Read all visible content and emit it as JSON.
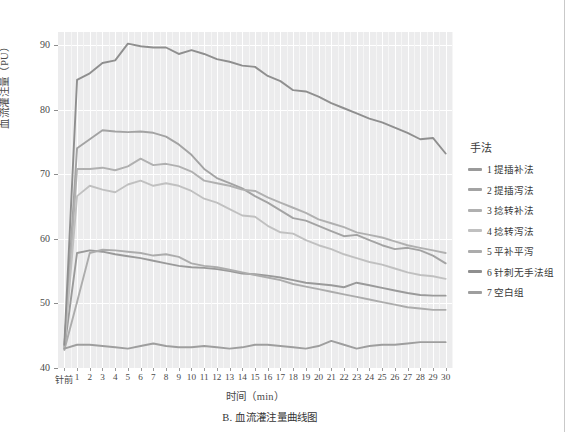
{
  "figure": {
    "caption": "B. 血流灌注量曲线图"
  },
  "axes": {
    "ylabel": "血流灌注量（PU）",
    "xlabel": "时间（min）",
    "yticks": [
      "40",
      "50",
      "60",
      "70",
      "80",
      "90"
    ],
    "xticks": [
      "针前",
      "1",
      "2",
      "3",
      "4",
      "5",
      "6",
      "7",
      "8",
      "9",
      "10",
      "11",
      "12",
      "13",
      "14",
      "15",
      "16",
      "17",
      "18",
      "19",
      "20",
      "21",
      "22",
      "23",
      "24",
      "25",
      "26",
      "27",
      "28",
      "29",
      "30"
    ]
  },
  "legend": {
    "title": "手法",
    "items": [
      {
        "label": "1 提插补法",
        "color": "#9a9a9a"
      },
      {
        "label": "2 提插泻法",
        "color": "#a3a3a3"
      },
      {
        "label": "3 捻转补法",
        "color": "#b0b0b0"
      },
      {
        "label": "4 捻转泻法",
        "color": "#c0c0c0"
      },
      {
        "label": "5 平补平泻",
        "color": "#acacac"
      },
      {
        "label": "6 针刺无手法组",
        "color": "#8f8f8f"
      },
      {
        "label": "7 空白组",
        "color": "#9e9e9e"
      }
    ]
  },
  "chart_data": {
    "type": "line",
    "title": "B. 血流灌注量曲线图",
    "xlabel": "时间（min）",
    "ylabel": "血流灌注量（PU）",
    "ylim": [
      40,
      92
    ],
    "grid": true,
    "legend_position": "right",
    "legend_title": "手法",
    "x": [
      "针前",
      "1",
      "2",
      "3",
      "4",
      "5",
      "6",
      "7",
      "8",
      "9",
      "10",
      "11",
      "12",
      "13",
      "14",
      "15",
      "16",
      "17",
      "18",
      "19",
      "20",
      "21",
      "22",
      "23",
      "24",
      "25",
      "26",
      "27",
      "28",
      "29",
      "30"
    ],
    "series": [
      {
        "name": "1 提插补法",
        "color": "#9a9a9a",
        "values": [
          43.0,
          57.8,
          58.2,
          58.0,
          57.6,
          57.3,
          57.0,
          56.6,
          56.2,
          55.8,
          55.6,
          55.5,
          55.3,
          55.0,
          54.6,
          54.5,
          54.3,
          54.0,
          53.6,
          53.2,
          53.0,
          52.8,
          52.5,
          53.2,
          52.8,
          52.4,
          52.0,
          51.6,
          51.3,
          51.2,
          51.2
        ]
      },
      {
        "name": "2 提插泻法",
        "color": "#a3a3a3",
        "values": [
          43.2,
          74.0,
          75.4,
          76.8,
          76.6,
          76.5,
          76.6,
          76.4,
          75.8,
          74.6,
          73.0,
          70.8,
          69.4,
          68.6,
          67.8,
          66.6,
          65.6,
          64.4,
          63.2,
          62.8,
          62.0,
          61.2,
          60.4,
          60.6,
          59.8,
          59.0,
          58.4,
          58.6,
          58.2,
          57.4,
          56.2
        ]
      },
      {
        "name": "3 捻转补法",
        "color": "#b0b0b0",
        "values": [
          43.4,
          70.8,
          70.8,
          71.0,
          70.6,
          71.2,
          72.4,
          71.4,
          71.6,
          71.2,
          70.4,
          69.0,
          68.6,
          68.2,
          67.6,
          67.4,
          66.4,
          65.6,
          64.8,
          64.0,
          63.0,
          62.4,
          61.8,
          61.0,
          60.6,
          60.2,
          59.6,
          59.0,
          58.6,
          58.2,
          57.8
        ]
      },
      {
        "name": "4 捻转泻法",
        "color": "#c0c0c0",
        "values": [
          43.0,
          66.6,
          68.2,
          67.6,
          67.2,
          68.4,
          69.0,
          68.2,
          68.6,
          68.2,
          67.4,
          66.2,
          65.6,
          64.6,
          63.6,
          63.4,
          62.0,
          61.0,
          60.8,
          59.8,
          59.0,
          58.4,
          57.6,
          57.0,
          56.4,
          56.0,
          55.4,
          54.8,
          54.4,
          54.2,
          53.8
        ]
      },
      {
        "name": "5 平补平泻",
        "color": "#acacac",
        "values": [
          42.8,
          50.2,
          57.8,
          58.3,
          58.2,
          58.0,
          57.8,
          57.4,
          57.6,
          57.2,
          56.2,
          55.8,
          55.6,
          55.2,
          54.8,
          54.4,
          54.0,
          53.6,
          53.0,
          52.6,
          52.2,
          51.8,
          51.4,
          51.0,
          50.6,
          50.2,
          49.8,
          49.4,
          49.2,
          49.0,
          49.0
        ]
      },
      {
        "name": "6 针刺无手法组",
        "color": "#8f8f8f",
        "values": [
          43.6,
          84.6,
          85.6,
          87.2,
          87.6,
          90.2,
          89.8,
          89.6,
          89.6,
          88.6,
          89.2,
          88.6,
          87.8,
          87.4,
          86.8,
          86.6,
          85.2,
          84.4,
          83.0,
          82.8,
          82.0,
          81.0,
          80.2,
          79.4,
          78.6,
          78.0,
          77.2,
          76.4,
          75.4,
          75.6,
          73.2
        ]
      },
      {
        "name": "7 空白组",
        "color": "#9e9e9e",
        "values": [
          43.0,
          43.6,
          43.6,
          43.4,
          43.2,
          43.0,
          43.4,
          43.8,
          43.4,
          43.2,
          43.2,
          43.4,
          43.2,
          43.0,
          43.2,
          43.6,
          43.6,
          43.4,
          43.2,
          43.0,
          43.4,
          44.2,
          43.6,
          43.0,
          43.4,
          43.6,
          43.6,
          43.8,
          44.0,
          44.0,
          44.0
        ]
      }
    ]
  }
}
